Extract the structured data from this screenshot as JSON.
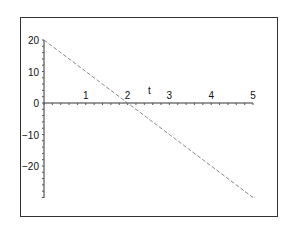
{
  "chart_data": {
    "type": "line",
    "title": "",
    "xlabel": "t",
    "ylabel": "",
    "xlim": [
      0,
      5
    ],
    "ylim": [
      -30,
      20
    ],
    "x_ticks": [
      "1",
      "2",
      "3",
      "4",
      "5"
    ],
    "y_ticks": [
      "20",
      "10",
      "0",
      "-10",
      "-20"
    ],
    "series": [
      {
        "name": "line",
        "style": "dashed",
        "color": "#888888",
        "x": [
          0,
          5
        ],
        "y": [
          20,
          -30
        ]
      }
    ],
    "grid": false,
    "legend": null
  }
}
